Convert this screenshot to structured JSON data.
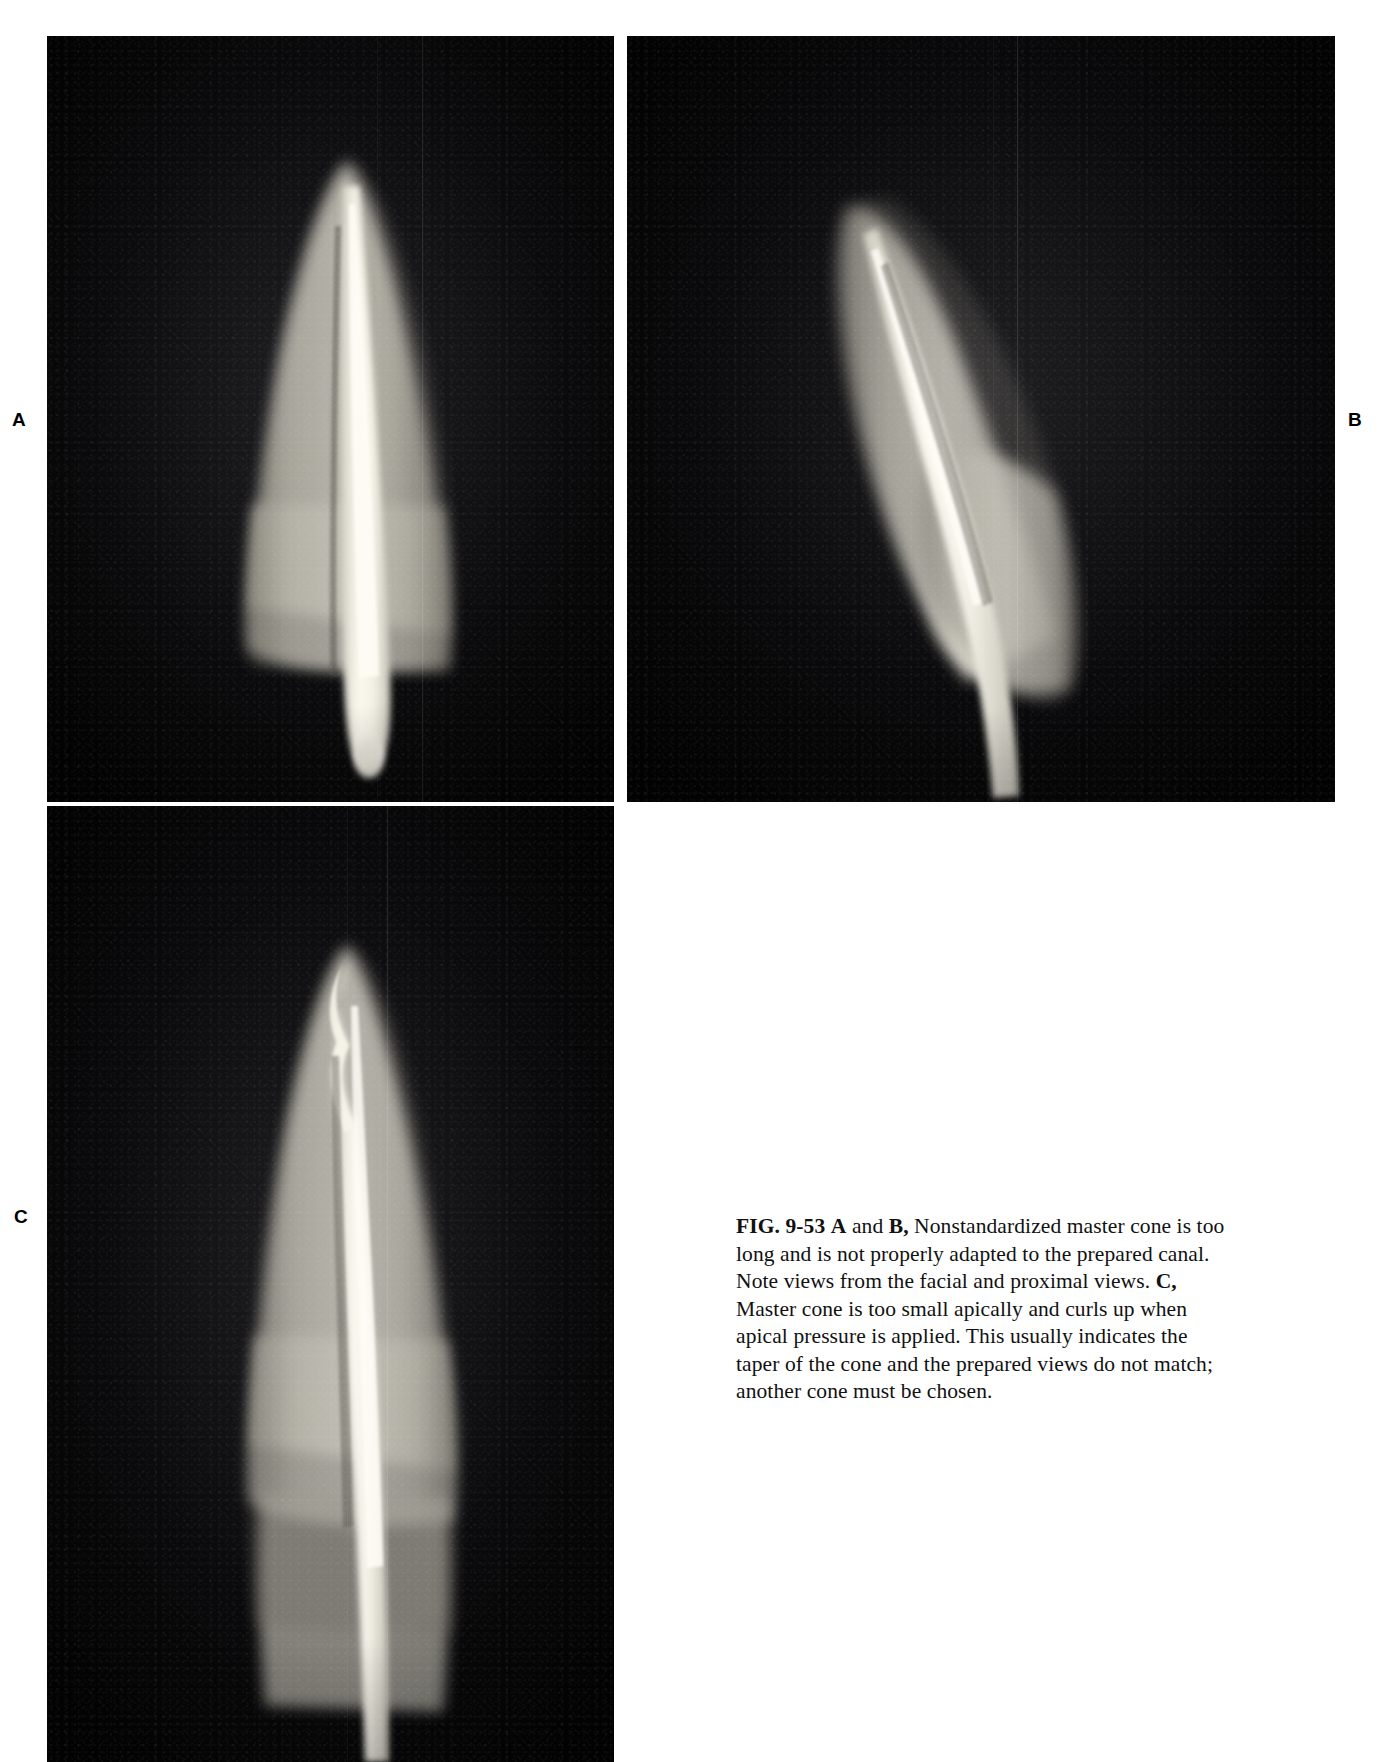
{
  "figure": {
    "number": "FIG. 9-53",
    "panels": [
      {
        "id": "A",
        "label": "A",
        "view": "facial view radiograph",
        "description": "Nonstandardized master cone too long, not adapted to prepared canal"
      },
      {
        "id": "B",
        "label": "B",
        "view": "proximal view radiograph",
        "description": "Nonstandardized master cone too long, not adapted to prepared canal"
      },
      {
        "id": "C",
        "label": "C",
        "view": "facial view radiograph",
        "description": "Master cone too small apically, curls up under apical pressure"
      }
    ],
    "caption": {
      "fig_number": "FIG. 9-53",
      "part_ab_first": "A",
      "and_word": " and ",
      "part_ab_second": "B,",
      "segment_ab": " Nonstandardized master cone is too long and is not properly adapted to the prepared canal. Note views from the facial and proximal views. ",
      "part_c": "C,",
      "segment_c": " Master cone is too small apically and curls up when apical pressure is applied. This usually indicates the taper of the cone and the prepared views do not match; another cone must be chosen.",
      "full_text": "FIG. 9-53 A and B, Nonstandardized master cone is too long and is not properly adapted to the prepared canal. Note views from the facial and proximal views. C, Master cone is too small apically and curls up when apical pressure is applied. This usually indicates the taper of the cone and the prepared views do not match; another cone must be chosen."
    }
  },
  "colors": {
    "page_background": "#ffffff",
    "film_background": "#050505",
    "text": "#111111",
    "tooth_highlight": "#e9e6dc",
    "cone_highlight": "#f2efe6"
  }
}
